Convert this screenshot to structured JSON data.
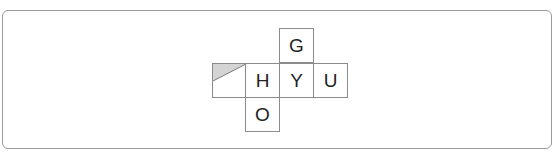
{
  "diagram": {
    "type": "cube-net",
    "cells": [
      {
        "id": "shaded",
        "label": "",
        "row": 1,
        "col": 0,
        "note": "upper-left triangle shaded grey"
      },
      {
        "id": "G",
        "label": "G",
        "row": 0,
        "col": 2
      },
      {
        "id": "H",
        "label": "H",
        "row": 1,
        "col": 1
      },
      {
        "id": "Y",
        "label": "Y",
        "row": 1,
        "col": 2
      },
      {
        "id": "U",
        "label": "U",
        "row": 1,
        "col": 3
      },
      {
        "id": "O",
        "label": "O",
        "row": 2,
        "col": 1
      }
    ],
    "colors": {
      "border": "#8c8c8c",
      "shade": "#d4d4d4",
      "frame": "#9a9a9a"
    }
  }
}
